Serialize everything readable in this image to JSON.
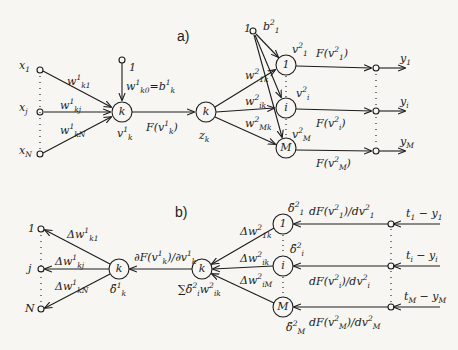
{
  "colors": {
    "ink": "#1c1c1c",
    "paper": "#f7f6f2"
  },
  "part_a": {
    "label": "a)",
    "inputs": [
      {
        "base": "x",
        "sub": "1",
        "weight": "w",
        "w_sup": "1",
        "w_sub": "k1"
      },
      {
        "base": "x",
        "sub": "j",
        "weight": "w",
        "w_sup": "1",
        "w_sub": "kj"
      },
      {
        "base": "x",
        "sub": "N",
        "weight": "w",
        "w_sup": "1",
        "w_sub": "kN"
      }
    ],
    "bias1": {
      "node": "1",
      "label": "w",
      "sup": "1",
      "sub": "k0",
      "eq": "=b",
      "eq_sup": "1",
      "eq_sub": "k"
    },
    "hidden_node": "k",
    "hidden_sum": {
      "base": "v",
      "sup": "1",
      "sub": "k"
    },
    "activation": {
      "text": "F(v",
      "sup": "1",
      "sub": "k",
      "close": ")"
    },
    "hidden_out_node": "k",
    "hidden_out": {
      "base": "z",
      "sub": "k"
    },
    "bias2": {
      "node": "1",
      "base": "b",
      "sup": "2",
      "sub": "1"
    },
    "output_weights": [
      {
        "base": "w",
        "sup": "2",
        "sub": "1k"
      },
      {
        "base": "w",
        "sup": "2",
        "sub": "ik"
      },
      {
        "base": "w",
        "sup": "2",
        "sub": "Mk"
      }
    ],
    "output_nodes": [
      "1",
      "i",
      "M"
    ],
    "output_sums": [
      {
        "base": "v",
        "sup": "2",
        "sub": "1"
      },
      {
        "base": "v",
        "sup": "2",
        "sub": "i"
      },
      {
        "base": "v",
        "sup": "2",
        "sub": "M"
      }
    ],
    "output_acts": [
      {
        "text": "F(v",
        "sup": "2",
        "sub": "1",
        "close": ")"
      },
      {
        "text": "F(v",
        "sup": "2",
        "sub": "i",
        "close": ")"
      },
      {
        "text": "F(v",
        "sup": "2",
        "sub": "M",
        "close": ")"
      }
    ],
    "outputs": [
      {
        "base": "y",
        "sub": "1"
      },
      {
        "base": "y",
        "sub": "i"
      },
      {
        "base": "y",
        "sub": "M"
      }
    ]
  },
  "part_b": {
    "label": "b)",
    "left_terminals": [
      "1",
      "j",
      "N"
    ],
    "delta_w1": [
      {
        "base": "Δw",
        "sup": "1",
        "sub": "k1"
      },
      {
        "base": "Δw",
        "sup": "1",
        "sub": "kj"
      },
      {
        "base": "Δw",
        "sup": "1",
        "sub": "kN"
      }
    ],
    "node1": "k",
    "node1_delta": {
      "base": "δ̃",
      "sup": "1",
      "sub": "k"
    },
    "derivative": {
      "text": "∂F(v",
      "sup": "1",
      "sub": "k",
      "mid": ")/∂v",
      "sup2": "1",
      "sub2": "k"
    },
    "node2": "k",
    "node2_sum": {
      "text": "∑δ̃",
      "sup": "2",
      "sub": "i",
      "w": "w",
      "w_sup": "2",
      "w_sub": "ik"
    },
    "delta_w2": [
      {
        "base": "Δw",
        "sup": "2",
        "sub": "1k"
      },
      {
        "base": "Δw",
        "sup": "2",
        "sub": "ik"
      },
      {
        "base": "Δw",
        "sup": "2",
        "sub": "iM"
      }
    ],
    "output_nodes": [
      "1",
      "i",
      "M"
    ],
    "output_deltas": [
      {
        "base": "δ̃",
        "sup": "2",
        "sub": "1"
      },
      {
        "base": "δ̃",
        "sup": "2",
        "sub": "i"
      },
      {
        "base": "δ̃",
        "sup": "2",
        "sub": "M"
      }
    ],
    "output_derivs": [
      {
        "text": "dF(v",
        "sup": "2",
        "sub": "1",
        "mid": ")/dv",
        "sup2": "2",
        "sub2": "1"
      },
      {
        "text": "dF(v",
        "sup": "2",
        "sub": "i",
        "mid": ")/dv",
        "sup2": "2",
        "sub2": "i"
      },
      {
        "text": "dF(v",
        "sup": "2",
        "sub": "M",
        "mid": ")/dv",
        "sup2": "2",
        "sub2": "M"
      }
    ],
    "errors": [
      {
        "t": "t",
        "t_sub": "1",
        "minus": " − ",
        "y": "y",
        "y_sub": "1"
      },
      {
        "t": "t",
        "t_sub": "i",
        "minus": " − ",
        "y": "y",
        "y_sub": "i"
      },
      {
        "t": "t",
        "t_sub": "M",
        "minus": " − ",
        "y": "y",
        "y_sub": "M"
      }
    ]
  }
}
